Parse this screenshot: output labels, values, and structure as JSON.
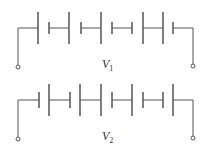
{
  "circuits": [
    {
      "label": "V",
      "subscript": "1",
      "wire_y": 28,
      "long_top": 12,
      "long_bottom": 44,
      "short_top": 22,
      "short_bottom": 34,
      "plates": [
        {
          "x": 38,
          "type": "long"
        },
        {
          "x": 49,
          "type": "short"
        },
        {
          "x": 69,
          "type": "long"
        },
        {
          "x": 81,
          "type": "short"
        },
        {
          "x": 101,
          "type": "long"
        },
        {
          "x": 112,
          "type": "short"
        },
        {
          "x": 132,
          "type": "short"
        },
        {
          "x": 143,
          "type": "long"
        },
        {
          "x": 163,
          "type": "long"
        },
        {
          "x": 173,
          "type": "short"
        }
      ],
      "terminal_y": 67
    },
    {
      "label": "V",
      "subscript": "2",
      "wire_y": 100,
      "long_top": 84,
      "long_bottom": 116,
      "short_top": 92,
      "short_bottom": 108,
      "plates": [
        {
          "x": 39,
          "type": "short"
        },
        {
          "x": 49,
          "type": "long"
        },
        {
          "x": 70,
          "type": "short"
        },
        {
          "x": 80,
          "type": "long"
        },
        {
          "x": 101,
          "type": "long"
        },
        {
          "x": 112,
          "type": "short"
        },
        {
          "x": 132,
          "type": "long"
        },
        {
          "x": 143,
          "type": "short"
        },
        {
          "x": 163,
          "type": "short"
        },
        {
          "x": 173,
          "type": "long"
        }
      ],
      "terminal_y": 139
    }
  ],
  "wire_left_x": 18,
  "wire_right_x": 193,
  "color": "#555555"
}
